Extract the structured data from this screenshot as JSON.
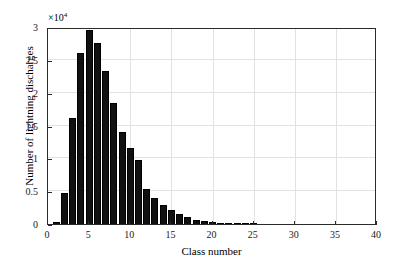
{
  "figure": {
    "background_color": "#ffffff",
    "bar_color": "#111111",
    "grid_color": "#e2e2e2",
    "axis_color": "#2b2b2b"
  },
  "axis": {
    "multiplier_prefix": "×10",
    "multiplier_exponent": "4",
    "xlabel": "Class number",
    "ylabel": "Number of lightning discharges",
    "xticklabels": [
      "0",
      "5",
      "10",
      "15",
      "20",
      "25",
      "30",
      "35",
      "40"
    ],
    "xtickvalues": [
      0,
      5,
      10,
      15,
      20,
      25,
      30,
      35,
      40
    ],
    "yticklabels": [
      "0",
      "0.5",
      "1",
      "1.5",
      "2",
      "2.5",
      "3"
    ],
    "ytickvalues": [
      0,
      5000,
      10000,
      15000,
      20000,
      25000,
      30000
    ]
  },
  "chart_data": {
    "type": "bar",
    "title": "",
    "subtitle": "",
    "xlabel": "Class number",
    "ylabel": "Number of lightning discharges",
    "y_multiplier": 10000,
    "y_multiplier_label": "×10^4",
    "xlim": [
      0,
      40
    ],
    "ylim": [
      0,
      30000
    ],
    "xticks": [
      0,
      5,
      10,
      15,
      20,
      25,
      30,
      35,
      40
    ],
    "yticks": [
      0,
      5000,
      10000,
      15000,
      20000,
      25000,
      30000
    ],
    "grid": true,
    "legend": null,
    "bar_width": 0.85,
    "categories": [
      1,
      2,
      3,
      4,
      5,
      6,
      7,
      8,
      9,
      10,
      11,
      12,
      13,
      14,
      15,
      16,
      17,
      18,
      19,
      20,
      21,
      22,
      23,
      24,
      25
    ],
    "values": [
      300,
      4700,
      16200,
      26100,
      29500,
      27500,
      23300,
      18400,
      14000,
      11500,
      9800,
      5400,
      3900,
      2950,
      2200,
      1500,
      1000,
      650,
      420,
      300,
      220,
      150,
      90,
      55,
      30
    ],
    "series": [
      {
        "name": "Number of lightning discharges",
        "values": [
          300,
          4700,
          16200,
          26100,
          29500,
          27500,
          23300,
          18400,
          14000,
          11500,
          9800,
          5400,
          3900,
          2950,
          2200,
          1500,
          1000,
          650,
          420,
          300,
          220,
          150,
          90,
          55,
          30
        ]
      }
    ]
  }
}
